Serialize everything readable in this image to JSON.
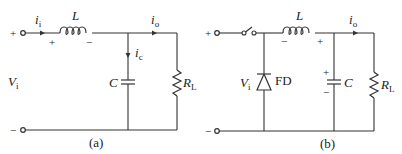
{
  "figures": [
    {
      "id": "a",
      "caption": "(a)",
      "input_voltage": {
        "symbol": "V",
        "sub": "i"
      },
      "terminals": {
        "top": "+",
        "bottom": "−"
      },
      "input_current": {
        "symbol": "i",
        "sub": "i"
      },
      "inductor": {
        "symbol": "L",
        "polarity_left": "+",
        "polarity_right": "−"
      },
      "capacitor": {
        "symbol": "C"
      },
      "capacitor_current": {
        "symbol": "i",
        "sub": "c"
      },
      "output_current": {
        "symbol": "i",
        "sub": "o"
      },
      "load": {
        "symbol": "R",
        "sub": "L"
      }
    },
    {
      "id": "b",
      "caption": "(b)",
      "input_voltage": {
        "symbol": "V",
        "sub": "i"
      },
      "terminals": {
        "top": "+",
        "bottom": "−"
      },
      "switch": "switch",
      "diode": {
        "label": "FD"
      },
      "inductor": {
        "symbol": "L",
        "polarity_left": "−",
        "polarity_right": "+"
      },
      "capacitor": {
        "symbol": "C",
        "polarity_top": "+",
        "polarity_bottom": "−"
      },
      "output_current": {
        "symbol": "i",
        "sub": "o"
      },
      "load": {
        "symbol": "R",
        "sub": "L"
      }
    }
  ]
}
